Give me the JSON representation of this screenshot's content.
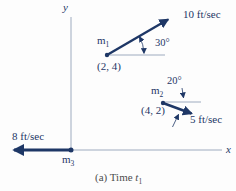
{
  "diagram": {
    "axes": {
      "x_label": "x",
      "y_label": "y"
    },
    "caption": {
      "prefix": "(a) Time ",
      "variable": "t",
      "subscript": "1"
    },
    "colors": {
      "ink": "#1e3766",
      "axis": "#93a2b8",
      "caption": "#4d4d4d",
      "bg": "#fdfdfd"
    }
  },
  "particles": {
    "m1": {
      "symbol": "m",
      "subscript": "1",
      "position": "(2, 4)",
      "velocity": "10 ft/sec",
      "angle": "30°"
    },
    "m2": {
      "symbol": "m",
      "subscript": "2",
      "position": "(4, 2)",
      "velocity": "5 ft/sec",
      "angle": "20°"
    },
    "m3": {
      "symbol": "m",
      "subscript": "3",
      "velocity": "8 ft/sec"
    }
  }
}
